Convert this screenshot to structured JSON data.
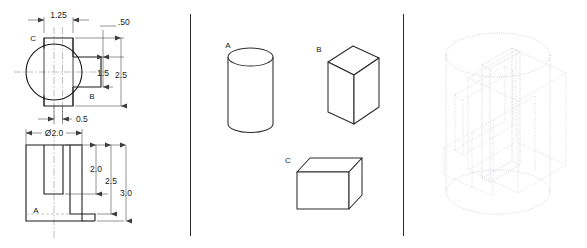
{
  "drawing": {
    "title": "Engineering drawing - orthographic views, primitive solids and wireframe assembly",
    "panels": [
      "orthographic-views",
      "primitive-solids",
      "wireframe-assembly"
    ]
  },
  "panel_left": {
    "name": "orthographic-views",
    "top_view": {
      "name": "top-view",
      "part_labels": [
        {
          "id": "C",
          "text": "C"
        },
        {
          "id": "B",
          "text": "B"
        }
      ],
      "dimensions": [
        {
          "id": "width-1-25",
          "text": "1.25",
          "orientation": "horizontal"
        },
        {
          "id": "depth-0-50",
          "text": ".50",
          "orientation": "vertical"
        },
        {
          "id": "depth-1-5",
          "text": "1.5",
          "orientation": "vertical"
        },
        {
          "id": "depth-2-5",
          "text": "2.5",
          "orientation": "vertical"
        },
        {
          "id": "tab-0-5",
          "text": "0.5",
          "orientation": "horizontal"
        }
      ]
    },
    "front_view": {
      "name": "front-view",
      "part_labels": [
        {
          "id": "A",
          "text": "A"
        }
      ],
      "dimensions": [
        {
          "id": "diameter-2-0",
          "text": "Ø2.0",
          "orientation": "horizontal"
        },
        {
          "id": "height-2-0",
          "text": "2.0",
          "orientation": "vertical"
        },
        {
          "id": "height-2-5",
          "text": "2.5",
          "orientation": "vertical"
        },
        {
          "id": "height-3-0",
          "text": "3.0",
          "orientation": "vertical"
        }
      ]
    }
  },
  "panel_middle": {
    "name": "primitive-solids",
    "solids": [
      {
        "id": "A",
        "label": "A",
        "shape": "cylinder"
      },
      {
        "id": "B",
        "label": "B",
        "shape": "rectangular-prism"
      },
      {
        "id": "C",
        "label": "C",
        "shape": "flat-plate"
      }
    ]
  },
  "panel_right": {
    "name": "wireframe-assembly",
    "description": "Dotted isometric wireframe of cylinder, prism and plate combined",
    "components": [
      "cylinder",
      "rectangular-prism",
      "flat-plate"
    ]
  },
  "colors": {
    "line": "#1a1a1a",
    "dimension": "#3c3c3c",
    "center": "#8a8a8a",
    "hidden": "#9a9a9a",
    "wireframe": "#b9b9c4",
    "background": "#ffffff"
  }
}
